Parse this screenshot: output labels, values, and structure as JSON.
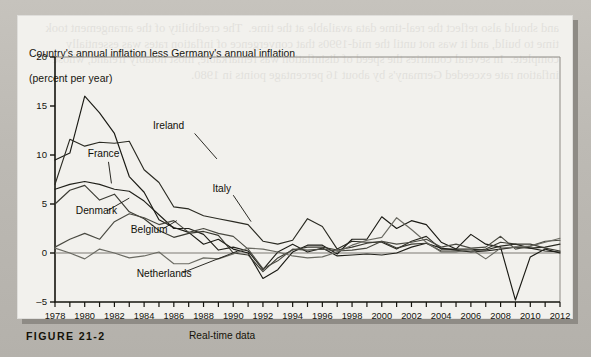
{
  "figure": {
    "number": "FIGURE 21-2",
    "subtitle": "Real-time data",
    "title_line1": "Country's annual inflation less Germany's annual inflation",
    "title_line2": "(percent per year)",
    "background_color": "#b9b6b0",
    "panel_color": "#f2f1ed",
    "ink_color": "#15140e"
  },
  "bleed_text": "and should also reflect the real-time data available at the time.  Therefore the credibility of the policy did not increase enough to offset the inflation bias, so real-time measures such as this one tend to overstate how rapidly convergence was achieved across the European Monetary System member countries.  It is clear from the figure that inflation differentials narrowed substantially over the 1980s and 1990s.",
  "panel_bleed_text": "and should also reflect the real-time data available at the time.  The credibility of the arrangement took time to build, and it was not until the mid-1990s that convergence of inflation rates was essentially complete.  In several countries the speed of disinflation was remarkable, most notably Ireland, whose inflation rate exceeded Germany's by about 16 percentage points in 1980.",
  "chart_data": {
    "type": "line",
    "title": "Country's annual inflation less Germany's annual inflation (percent per year)",
    "xlabel": "",
    "ylabel": "percent per year",
    "xlim": [
      1978,
      2012
    ],
    "ylim": [
      -5,
      20
    ],
    "yticks": [
      -5,
      0,
      5,
      10,
      15,
      20
    ],
    "ytick_labels": [
      "-5",
      "0",
      "5",
      "10",
      "15",
      "20"
    ],
    "xticks": [
      1978,
      1979,
      1980,
      1981,
      1982,
      1983,
      1984,
      1985,
      1986,
      1987,
      1988,
      1989,
      1990,
      1991,
      1992,
      1993,
      1994,
      1995,
      1996,
      1997,
      1998,
      1999,
      2000,
      2001,
      2002,
      2003,
      2004,
      2005,
      2006,
      2007,
      2008,
      2009,
      2010,
      2011,
      2012
    ],
    "xtick_labels": [
      "1978",
      "1980",
      "1982",
      "1984",
      "1986",
      "1988",
      "1990",
      "1992",
      "1994",
      "1996",
      "1998",
      "2000",
      "2002",
      "2004",
      "2006",
      "2008",
      "2010",
      "2012"
    ],
    "xtick_label_years": [
      1978,
      1980,
      1982,
      1984,
      1986,
      1988,
      1990,
      1992,
      1994,
      1996,
      1998,
      2000,
      2002,
      2004,
      2006,
      2008,
      2010,
      2012
    ],
    "grid": false,
    "legend": "inline-labels",
    "zero_line": 0,
    "x": [
      1978,
      1979,
      1980,
      1981,
      1982,
      1983,
      1984,
      1985,
      1986,
      1987,
      1988,
      1989,
      1990,
      1991,
      1992,
      1993,
      1994,
      1995,
      1996,
      1997,
      1998,
      1999,
      2000,
      2001,
      2002,
      2003,
      2004,
      2005,
      2006,
      2007,
      2008,
      2009,
      2010,
      2011,
      2012
    ],
    "series": [
      {
        "name": "Ireland",
        "color": "#1a1a14",
        "values": [
          9.5,
          10.2,
          16.0,
          14.3,
          12.2,
          7.8,
          6.2,
          3.4,
          2.6,
          2.1,
          0.9,
          1.4,
          0.4,
          0.0,
          -2.6,
          -1.7,
          0.1,
          0.8,
          0.8,
          -0.1,
          1.4,
          1.4,
          3.7,
          2.5,
          3.3,
          2.9,
          1.1,
          0.4,
          1.9,
          0.9,
          0.6,
          -4.8,
          -0.4,
          0.4,
          0.0
        ]
      },
      {
        "name": "Italy",
        "color": "#2a2a22",
        "values": [
          7.0,
          11.6,
          10.9,
          11.3,
          11.2,
          11.4,
          8.5,
          7.2,
          4.7,
          4.5,
          3.8,
          3.5,
          3.2,
          2.9,
          1.2,
          0.9,
          1.3,
          3.5,
          2.7,
          0.4,
          1.2,
          1.1,
          1.1,
          0.4,
          1.2,
          1.7,
          0.4,
          0.4,
          0.4,
          0.3,
          0.7,
          0.9,
          0.5,
          0.6,
          0.9
        ]
      },
      {
        "name": "France",
        "color": "#20201a",
        "values": [
          6.5,
          7.0,
          7.3,
          7.0,
          6.5,
          6.3,
          5.3,
          3.9,
          2.5,
          2.5,
          1.9,
          0.3,
          0.6,
          0.2,
          -1.7,
          0.1,
          0.9,
          0.1,
          0.5,
          -0.3,
          -0.2,
          -0.1,
          -0.2,
          0.0,
          0.6,
          1.0,
          0.5,
          0.3,
          0.1,
          0.2,
          0.4,
          0.6,
          0.5,
          0.2,
          0.1
        ]
      },
      {
        "name": "Denmark",
        "color": "#3a3a32",
        "values": [
          5.0,
          6.4,
          6.9,
          5.4,
          6.0,
          4.2,
          3.5,
          2.3,
          1.6,
          2.0,
          2.2,
          1.8,
          0.0,
          -0.2,
          -1.9,
          -0.5,
          0.3,
          0.6,
          0.6,
          0.3,
          0.6,
          1.0,
          1.2,
          0.5,
          0.9,
          1.0,
          0.2,
          0.2,
          0.2,
          0.4,
          1.1,
          0.9,
          0.9,
          0.5,
          0.2
        ]
      },
      {
        "name": "Belgium",
        "color": "#4a4a42",
        "values": [
          0.6,
          1.4,
          2.0,
          1.4,
          3.2,
          4.0,
          3.6,
          2.9,
          3.3,
          2.1,
          2.5,
          2.0,
          1.7,
          0.4,
          -1.6,
          -0.8,
          0.4,
          0.3,
          0.4,
          0.2,
          0.3,
          0.5,
          1.2,
          0.9,
          1.1,
          1.4,
          0.6,
          0.9,
          0.5,
          0.6,
          1.7,
          0.4,
          0.7,
          1.2,
          1.3
        ]
      },
      {
        "name": "Netherlands",
        "color": "#6a6a62",
        "values": [
          0.5,
          0.0,
          -0.6,
          0.4,
          0.0,
          -0.5,
          -0.3,
          0.1,
          -1.1,
          -1.1,
          -0.5,
          -0.6,
          -0.1,
          0.5,
          0.4,
          0.1,
          -0.3,
          -0.5,
          -0.4,
          0.1,
          0.8,
          1.3,
          1.6,
          3.6,
          2.4,
          1.1,
          0.1,
          0.1,
          0.4,
          -0.6,
          0.5,
          0.6,
          0.7,
          1.1,
          1.5
        ]
      }
    ],
    "annotations": [
      {
        "label": "Ireland",
        "x": 1984.6,
        "y": 13.0
      },
      {
        "label": "France",
        "x": 1980.2,
        "y": 10.2
      },
      {
        "label": "Denmark",
        "x": 1979.4,
        "y": 4.3
      },
      {
        "label": "Belgium",
        "x": 1983.1,
        "y": 2.4
      },
      {
        "label": "Netherlands",
        "x": 1983.5,
        "y": -2.1
      },
      {
        "label": "Italy",
        "x": 1988.6,
        "y": 6.6
      }
    ]
  }
}
